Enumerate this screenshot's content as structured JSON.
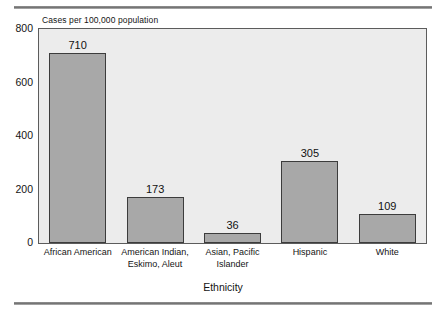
{
  "figure": {
    "name": "tuberculosis-cases-by-ethnicity-bar-chart"
  },
  "chart_data": {
    "type": "bar",
    "title": "",
    "subtitle": "",
    "caption": "Cases per 100,000 population",
    "xlabel": "Ethnicity",
    "ylabel": "Cases per 100,000 population",
    "categories": [
      "African American",
      "American Indian, Eskimo, Aleut",
      "Asian, Pacific Islander",
      "Hispanic",
      "White"
    ],
    "category_lines": [
      [
        "African American"
      ],
      [
        "American Indian,",
        "Eskimo, Aleut"
      ],
      [
        "Asian, Pacific",
        "Islander"
      ],
      [
        "Hispanic"
      ],
      [
        "White"
      ]
    ],
    "values": [
      710,
      173,
      36,
      305,
      109
    ],
    "value_labels": [
      "710",
      "173",
      "36",
      "305",
      "109"
    ],
    "ylim": [
      0,
      800
    ],
    "yticks": [
      0,
      200,
      400,
      600,
      800
    ],
    "ytick_labels": [
      "0",
      "200",
      "400",
      "600",
      "800"
    ],
    "grid": false,
    "legend": false,
    "legend_position": "none",
    "colors": {
      "bar_fill": "#a8a8a8",
      "bar_edge": "#3c3c3c",
      "plot_background": "#ececec",
      "plot_border": "#5c5c5c",
      "page_background": "#ffffff",
      "text": "#141414",
      "rule": "#6e6e6e"
    }
  }
}
